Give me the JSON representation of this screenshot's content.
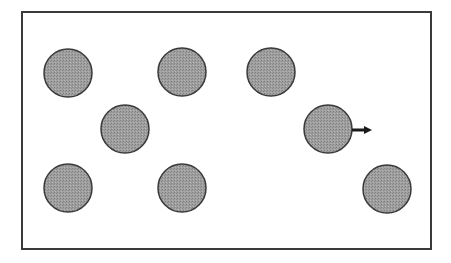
{
  "diagram": {
    "type": "particles-in-box",
    "frame": {
      "x": 22,
      "y": 12,
      "width": 409,
      "height": 237,
      "stroke": "#3a3a3a",
      "stroke_width": 2
    },
    "particle_style": {
      "radius": 24,
      "fill": "#9a9a9a",
      "stroke": "#3a3a3a",
      "stroke_width": 1.5
    },
    "particles": [
      {
        "id": 1,
        "cx": 68,
        "cy": 73,
        "moving": false
      },
      {
        "id": 2,
        "cx": 182,
        "cy": 72,
        "moving": false
      },
      {
        "id": 3,
        "cx": 271,
        "cy": 72,
        "moving": false
      },
      {
        "id": 4,
        "cx": 125,
        "cy": 129,
        "moving": false
      },
      {
        "id": 5,
        "cx": 328,
        "cy": 129,
        "moving": true,
        "direction": "right"
      },
      {
        "id": 6,
        "cx": 68,
        "cy": 188,
        "moving": false
      },
      {
        "id": 7,
        "cx": 182,
        "cy": 188,
        "moving": false
      },
      {
        "id": 8,
        "cx": 387,
        "cy": 189,
        "moving": false
      }
    ],
    "arrow": {
      "x1": 352,
      "y1": 130,
      "x2": 374,
      "y2": 130,
      "color": "#1a1a1a",
      "icon": "arrow-right-icon"
    }
  }
}
